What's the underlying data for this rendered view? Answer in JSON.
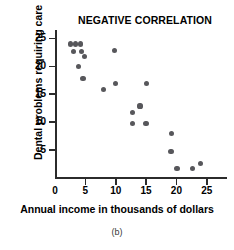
{
  "chart_data": {
    "type": "scatter",
    "title": "NEGATIVE CORRELATION",
    "xlabel": "Annual income in thousands of dollars",
    "ylabel": "Dental problems requiring care",
    "caption": "(b)",
    "xlim": [
      0,
      28
    ],
    "ylim": [
      0,
      26.5
    ],
    "xticks": [
      0,
      5,
      10,
      15,
      20,
      25
    ],
    "yticks": [
      5,
      10,
      15,
      20,
      25
    ],
    "xtick_labels": [
      "0",
      "5",
      "10",
      "15",
      "20",
      "25"
    ],
    "ytick_labels": [
      "5",
      "10",
      "15",
      "20",
      "25"
    ],
    "grid": false,
    "legend": false,
    "marker_color": "#57575b",
    "axis_color": "#2b2b2b",
    "points": [
      {
        "x": 2.6,
        "y": 24.0
      },
      {
        "x": 3.4,
        "y": 24.0
      },
      {
        "x": 4.2,
        "y": 24.0
      },
      {
        "x": 3.1,
        "y": 22.7
      },
      {
        "x": 4.3,
        "y": 22.7
      },
      {
        "x": 4.9,
        "y": 21.8
      },
      {
        "x": 3.9,
        "y": 19.9
      },
      {
        "x": 4.6,
        "y": 17.8
      },
      {
        "x": 9.8,
        "y": 22.9
      },
      {
        "x": 8.0,
        "y": 15.9
      },
      {
        "x": 9.9,
        "y": 16.9
      },
      {
        "x": 15.1,
        "y": 16.9
      },
      {
        "x": 14.0,
        "y": 12.9
      },
      {
        "x": 12.8,
        "y": 11.8
      },
      {
        "x": 12.7,
        "y": 9.8
      },
      {
        "x": 15.0,
        "y": 9.8
      },
      {
        "x": 19.2,
        "y": 7.9
      },
      {
        "x": 19.1,
        "y": 4.7
      },
      {
        "x": 20.1,
        "y": 1.7
      },
      {
        "x": 22.6,
        "y": 1.7
      },
      {
        "x": 23.9,
        "y": 2.6
      }
    ]
  }
}
